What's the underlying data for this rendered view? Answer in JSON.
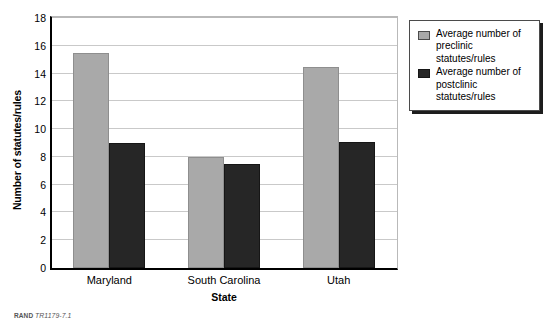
{
  "chart_data": {
    "type": "bar",
    "title": "",
    "xlabel": "State",
    "ylabel": "Number of statutes/rules",
    "categories": [
      "Maryland",
      "South Carolina",
      "Utah"
    ],
    "series": [
      {
        "name": "Average number of preclinic statutes/rules",
        "values": [
          15.5,
          8.0,
          14.5
        ],
        "color": "#a9a9a9"
      },
      {
        "name": "Average number of postclinic statutes/rules",
        "values": [
          9.0,
          7.5,
          9.1
        ],
        "color": "#262626"
      }
    ],
    "ylim": [
      0,
      18
    ],
    "yticks": [
      0,
      2,
      4,
      6,
      8,
      10,
      12,
      14,
      16,
      18
    ],
    "ytick_labels": [
      "0",
      "2",
      "4",
      "6",
      "8",
      "10",
      "12",
      "14",
      "16",
      "18"
    ],
    "grid": true,
    "grid_axis": "y",
    "legend_position": "right-top"
  },
  "legend": {
    "entries": [
      {
        "label": "Average number of preclinic statutes/rules",
        "swatch": "light-gray"
      },
      {
        "label": "Average number of postclinic statutes/rules",
        "swatch": "dark-gray"
      }
    ]
  },
  "credit": {
    "brand": "RAND",
    "id": "TR1179-7.1"
  }
}
